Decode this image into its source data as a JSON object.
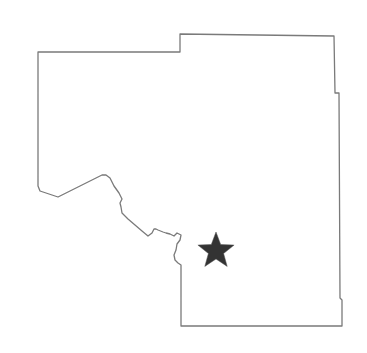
{
  "map": {
    "region": {
      "outline_color": "#7a7a7a",
      "fill_color": "#ffffff",
      "stroke_width": 1.3
    },
    "marker": {
      "icon": "star-icon",
      "color": "#333333",
      "center_x": 216,
      "center_y": 251,
      "outer_radius": 19,
      "inner_radius": 8
    }
  }
}
